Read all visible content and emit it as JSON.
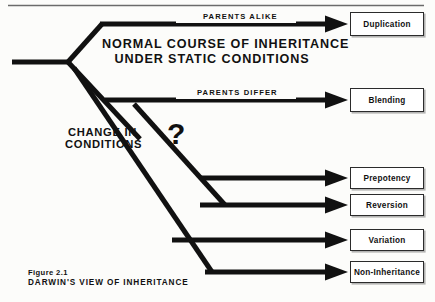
{
  "figure": {
    "caption_number": "Figure 2.1",
    "caption_title": "DARWIN'S VIEW OF INHERITANCE",
    "ink_color": "#111111",
    "background_color": "#fcfcfa",
    "box_border_color": "#2b2b2b"
  },
  "headings": {
    "center": "NORMAL COURSE OF INHERITANCE UNDER STATIC CONDITIONS",
    "center_line1": "NORMAL COURSE OF INHERITANCE",
    "center_line2": "UNDER STATIC CONDITIONS",
    "change_line1": "CHANGE IN",
    "change_line2": "CONDITIONS",
    "question_mark": "?"
  },
  "branch_labels": [
    {
      "id": "parents-alike",
      "text": "PARENTS ALIKE"
    },
    {
      "id": "parents-differ",
      "text": "PARENTS DIFFER"
    }
  ],
  "outcomes": [
    {
      "id": "duplication",
      "label": "Duplication"
    },
    {
      "id": "blending",
      "label": "Blending"
    },
    {
      "id": "prepotency",
      "label": "Prepotency"
    },
    {
      "id": "reversion",
      "label": "Reversion"
    },
    {
      "id": "variation",
      "label": "Variation"
    },
    {
      "id": "non-inheritance",
      "label": "Non-Inheritance"
    }
  ]
}
